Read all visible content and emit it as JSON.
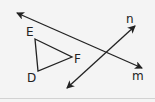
{
  "diagram": {
    "title": "",
    "colors": {
      "background": "#f4f4f4",
      "stroke": "#222222",
      "rule": "#d2d2d2"
    },
    "lines": [
      {
        "name": "m",
        "label": "m",
        "from": [
          17,
          13
        ],
        "to": [
          142,
          68
        ],
        "arrows": "both"
      },
      {
        "name": "n",
        "label": "n",
        "from": [
          67,
          88
        ],
        "to": [
          135,
          26
        ],
        "arrows": "both"
      }
    ],
    "triangle": {
      "vertices": [
        {
          "label": "E",
          "x": 35,
          "y": 39
        },
        {
          "label": "F",
          "x": 72,
          "y": 57
        },
        {
          "label": "D",
          "x": 38,
          "y": 71
        }
      ]
    },
    "labels": {
      "E": "E",
      "F": "F",
      "D": "D",
      "n": "n",
      "m": "m"
    }
  }
}
